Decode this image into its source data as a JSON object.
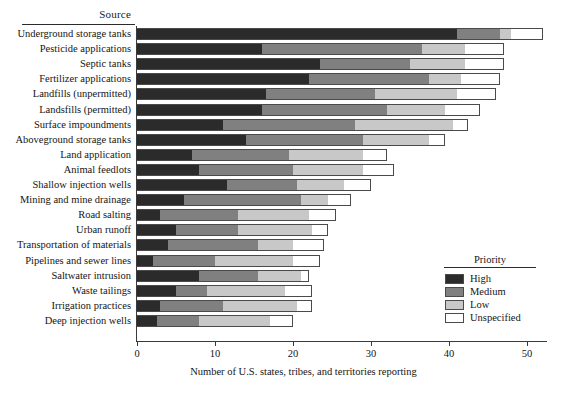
{
  "chart_data": {
    "type": "bar",
    "orientation": "horizontal",
    "stacked": true,
    "title": "",
    "ylabel": "Source",
    "xlabel": "Number of U.S. states, tribes, and territories reporting",
    "xlim": [
      0,
      53
    ],
    "xticks": [
      0,
      10,
      20,
      30,
      40,
      50
    ],
    "grid": false,
    "legend": {
      "title": "Priority",
      "position": "inside-right",
      "entries": [
        {
          "name": "High",
          "color": "#2b2b2b"
        },
        {
          "name": "Medium",
          "color": "#808080"
        },
        {
          "name": "Low",
          "color": "#c8c8c8"
        },
        {
          "name": "Unspecified",
          "color": "#ffffff"
        }
      ]
    },
    "categories": [
      "Underground storage tanks",
      "Pesticide applications",
      "Septic tanks",
      "Fertilizer applications",
      "Landfills (unpermitted)",
      "Landsfills (permitted)",
      "Surface impoundments",
      "Aboveground storage tanks",
      "Land application",
      "Animal feedlots",
      "Shallow injection wells",
      "Mining and mine drainage",
      "Road salting",
      "Urban runoff",
      "Transportation of materials",
      "Pipelines and sewer lines",
      "Saltwater intrusion",
      "Waste tailings",
      "Irrigation practices",
      "Deep injection wells"
    ],
    "series": [
      {
        "name": "High",
        "values": [
          41,
          16,
          23.5,
          22,
          16.5,
          16,
          11,
          14,
          7,
          8,
          11.5,
          6,
          3,
          5,
          4,
          2,
          8,
          5,
          3,
          2.5
        ]
      },
      {
        "name": "Medium",
        "values": [
          5.5,
          20.5,
          11.5,
          15.5,
          14,
          16,
          17,
          15,
          12.5,
          12,
          9,
          15,
          10,
          8,
          11.5,
          8,
          7.5,
          4,
          8,
          5.5
        ]
      },
      {
        "name": "Low",
        "values": [
          1.5,
          5.5,
          7,
          4,
          10.5,
          7.5,
          12.5,
          8.5,
          9.5,
          9,
          6,
          3.5,
          9,
          9.5,
          4.5,
          10,
          5.5,
          10,
          9.5,
          9
        ]
      },
      {
        "name": "Unspecified",
        "values": [
          4,
          5,
          5,
          5,
          5,
          4.5,
          2,
          2,
          3,
          4,
          3.5,
          3,
          3.5,
          2,
          4,
          3.5,
          1,
          3.5,
          2,
          3
        ]
      }
    ],
    "totals": [
      52,
      47,
      47,
      46.5,
      46,
      44,
      42.5,
      39.5,
      32,
      33,
      30,
      27.5,
      25.5,
      24.5,
      24,
      23.5,
      22,
      22.5,
      22.5,
      20
    ]
  }
}
